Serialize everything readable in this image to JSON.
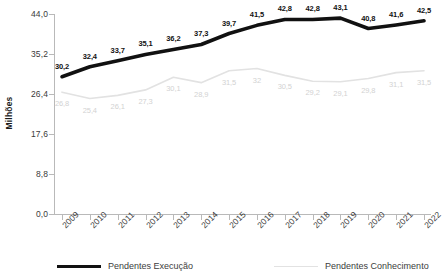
{
  "chart_data": {
    "type": "line",
    "title": "",
    "subtitle": "",
    "xlabel": "",
    "ylabel": "Milhões",
    "ylim": [
      0.0,
      44.0
    ],
    "y_ticks": [
      "0,0",
      "8,8",
      "17,6",
      "26,4",
      "35,2",
      "44,0"
    ],
    "y_tick_values": [
      0.0,
      8.8,
      17.6,
      26.4,
      35.2,
      44.0
    ],
    "grid": false,
    "legend_position": "bottom",
    "categories": [
      "2009",
      "2010",
      "2011",
      "2012",
      "2013",
      "2014",
      "2015",
      "2016",
      "2017",
      "2018",
      "2019",
      "2020",
      "2021",
      "2022"
    ],
    "series": [
      {
        "name": "Pendentes Execução",
        "color": "#111111",
        "values": [
          30.2,
          32.4,
          33.7,
          35.1,
          36.2,
          37.3,
          39.7,
          41.5,
          42.8,
          42.8,
          43.1,
          40.8,
          41.6,
          42.5
        ],
        "labels": [
          "30,2",
          "32,4",
          "33,7",
          "35,1",
          "36,2",
          "37,3",
          "39,7",
          "41,5",
          "42,8",
          "42,8",
          "43,1",
          "40,8",
          "41,6",
          "42,5"
        ]
      },
      {
        "name": "Pendentes Conhecimento",
        "color": "#e2e2e2",
        "values": [
          26.8,
          25.4,
          26.1,
          27.3,
          30.1,
          28.9,
          31.5,
          32.0,
          30.5,
          29.2,
          29.1,
          29.8,
          31.1,
          31.5
        ],
        "labels": [
          "26,8",
          "25,4",
          "26,1",
          "27,3",
          "30,1",
          "28,9",
          "31,5",
          "32",
          "30,5",
          "29,2",
          "29,1",
          "29,8",
          "31,1",
          "31,5"
        ]
      }
    ]
  },
  "legend": {
    "items": [
      {
        "label": "Pendentes Execução"
      },
      {
        "label": "Pendentes Conhecimento"
      }
    ]
  }
}
